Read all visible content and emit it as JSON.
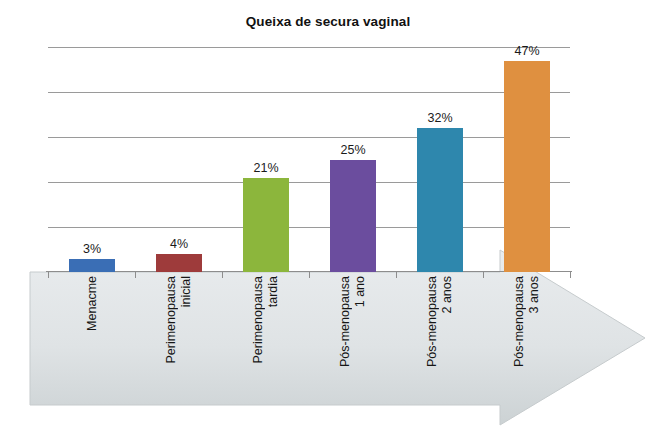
{
  "chart_data": {
    "type": "bar",
    "title": "Queixa de secura vaginal",
    "xlabel": "",
    "ylabel": "",
    "ylim": [
      0,
      50
    ],
    "grid": true,
    "gridlines": [
      10,
      20,
      30,
      40,
      50
    ],
    "legend": "none",
    "value_label_suffix": "%",
    "categories": [
      "Menacme",
      "Perimenopausa inicial",
      "Perimenopausa tardia",
      "Pós-menopausa 1 ano",
      "Pós-menopausa 2 anos",
      "Pós-menopausa 3 anos"
    ],
    "category_lines": [
      [
        "Menacme"
      ],
      [
        "Perimenopausa",
        "inicial"
      ],
      [
        "Perimenopausa",
        "tardia"
      ],
      [
        "Pós-menopausa",
        "1 ano"
      ],
      [
        "Pós-menopausa",
        "2 anos"
      ],
      [
        "Pós-menopausa",
        "3 anos"
      ]
    ],
    "values": [
      3,
      4,
      21,
      25,
      32,
      47
    ],
    "value_labels": [
      "3%",
      "4%",
      "21%",
      "25%",
      "32%",
      "47%"
    ],
    "colors": [
      "#3a6eb5",
      "#9e3b3b",
      "#8cb63c",
      "#6b4d9e",
      "#2e87ad",
      "#df9040"
    ]
  },
  "decor": {
    "arrow_fill": "#d6dadc",
    "arrow_label": "progression-arrow"
  }
}
